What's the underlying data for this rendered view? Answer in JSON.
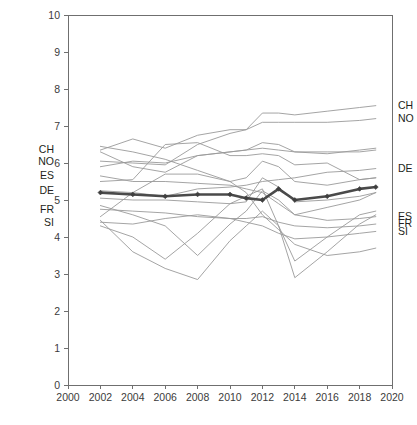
{
  "chart_data": {
    "type": "line",
    "title": "",
    "subtitle": "",
    "xlabel": "",
    "ylabel": "",
    "xlim": [
      2000,
      2020
    ],
    "ylim": [
      0,
      10
    ],
    "grid": false,
    "legend_position": "inline-end-labels",
    "x_ticks": [
      2000,
      2002,
      2004,
      2006,
      2008,
      2010,
      2012,
      2014,
      2016,
      2018,
      2020
    ],
    "y_ticks": [
      0,
      1,
      2,
      3,
      4,
      5,
      6,
      7,
      8,
      9,
      10
    ],
    "x": [
      2002,
      2004,
      2006,
      2008,
      2010,
      2011,
      2012,
      2013,
      2014,
      2016,
      2018,
      2019
    ],
    "series": [
      {
        "name": "CH",
        "label_left": "CH",
        "label_right": "CH",
        "color": "#9a9a9a",
        "highlight": false,
        "values": [
          6.35,
          6.65,
          6.4,
          6.75,
          6.9,
          6.9,
          7.35,
          7.35,
          7.3,
          7.4,
          7.5,
          7.55
        ]
      },
      {
        "name": "NO",
        "label_left": "NO",
        "label_right": "NO",
        "color": "#9a9a9a",
        "highlight": false,
        "values": [
          6.05,
          6.0,
          5.95,
          6.5,
          6.8,
          6.9,
          7.1,
          7.1,
          7.1,
          7.1,
          7.15,
          7.2
        ]
      },
      {
        "name": "ES",
        "label_left": "ES",
        "label_right": "ES",
        "color": "#9a9a9a",
        "highlight": false,
        "values": [
          5.65,
          5.5,
          5.5,
          5.45,
          5.4,
          5.3,
          5.2,
          4.9,
          4.6,
          4.45,
          4.5,
          4.55
        ]
      },
      {
        "name": "DE",
        "label_left": "DE",
        "label_right": "DE",
        "color": "#9a9a9a",
        "highlight": false,
        "values": [
          5.25,
          5.2,
          5.1,
          5.3,
          5.35,
          5.4,
          5.5,
          5.55,
          5.6,
          5.75,
          5.8,
          5.85
        ]
      },
      {
        "name": "FR",
        "label_left": "FR",
        "label_right": "FR",
        "color": "#9a9a9a",
        "highlight": false,
        "values": [
          4.75,
          4.7,
          4.65,
          4.55,
          4.5,
          4.5,
          4.55,
          4.4,
          4.3,
          4.25,
          4.3,
          4.35
        ]
      },
      {
        "name": "SI",
        "label_left": "SI",
        "label_right": "SI",
        "color": "#9a9a9a",
        "highlight": false,
        "values": [
          4.4,
          4.35,
          4.5,
          4.6,
          4.5,
          4.4,
          4.3,
          4.1,
          3.95,
          4.0,
          4.1,
          4.15
        ]
      },
      {
        "name": "country-7",
        "label_left": "",
        "label_right": "",
        "color": "#9a9a9a",
        "highlight": false,
        "values": [
          6.3,
          5.9,
          5.75,
          6.2,
          6.3,
          6.35,
          6.55,
          6.5,
          6.3,
          6.25,
          6.35,
          6.4
        ]
      },
      {
        "name": "country-8",
        "label_left": "",
        "label_right": "",
        "color": "#9a9a9a",
        "highlight": false,
        "values": [
          5.9,
          6.05,
          6.0,
          6.2,
          6.3,
          6.35,
          6.4,
          6.35,
          6.3,
          6.3,
          6.3,
          6.35
        ]
      },
      {
        "name": "country-9",
        "label_left": "",
        "label_right": "",
        "color": "#9a9a9a",
        "highlight": false,
        "values": [
          5.5,
          5.55,
          6.5,
          6.55,
          6.2,
          6.2,
          6.25,
          6.2,
          5.95,
          6.0,
          5.55,
          5.6
        ]
      },
      {
        "name": "country-10",
        "label_left": "",
        "label_right": "",
        "color": "#9a9a9a",
        "highlight": false,
        "values": [
          4.55,
          5.2,
          5.7,
          5.7,
          5.5,
          5.6,
          6.05,
          5.9,
          5.5,
          5.4,
          5.55,
          5.6
        ]
      },
      {
        "name": "country-11",
        "label_left": "",
        "label_right": "",
        "color": "#9a9a9a",
        "highlight": false,
        "values": [
          5.05,
          5.0,
          5.0,
          4.95,
          4.9,
          4.95,
          5.6,
          5.35,
          4.95,
          5.0,
          5.1,
          5.2
        ]
      },
      {
        "name": "country-12",
        "label_left": "",
        "label_right": "",
        "color": "#9a9a9a",
        "highlight": false,
        "values": [
          4.85,
          4.6,
          4.3,
          3.5,
          4.35,
          4.7,
          5.25,
          5.0,
          4.6,
          4.8,
          5.0,
          5.2
        ]
      },
      {
        "name": "country-13",
        "label_left": "",
        "label_right": "",
        "color": "#9a9a9a",
        "highlight": false,
        "values": [
          4.45,
          3.6,
          3.15,
          2.85,
          3.9,
          4.3,
          4.7,
          4.3,
          2.9,
          3.6,
          4.35,
          4.6
        ]
      },
      {
        "name": "country-14",
        "label_left": "",
        "label_right": "",
        "color": "#9a9a9a",
        "highlight": false,
        "values": [
          4.3,
          4.0,
          3.4,
          4.1,
          4.9,
          5.1,
          5.3,
          4.3,
          3.35,
          4.0,
          4.6,
          4.7
        ]
      },
      {
        "name": "country-15",
        "label_left": "",
        "label_right": "",
        "color": "#9a9a9a",
        "highlight": false,
        "values": [
          6.45,
          6.3,
          6.1,
          5.8,
          5.5,
          5.2,
          4.6,
          4.2,
          3.8,
          3.5,
          3.6,
          3.7
        ]
      },
      {
        "name": "average",
        "label_left": "",
        "label_right": "",
        "color": "#4a4a4a",
        "highlight": true,
        "values": [
          5.2,
          5.15,
          5.1,
          5.15,
          5.15,
          5.05,
          5.0,
          5.3,
          5.0,
          5.1,
          5.3,
          5.35
        ]
      }
    ]
  },
  "axes": {
    "y_tick_labels": [
      "0",
      "1",
      "2",
      "3",
      "4",
      "5",
      "6",
      "7",
      "8",
      "9",
      "10"
    ],
    "x_tick_labels": [
      "2000",
      "2002",
      "2004",
      "2006",
      "2008",
      "2010",
      "2012",
      "2014",
      "2016",
      "2018",
      "2020"
    ]
  },
  "caption": {
    "text": ""
  }
}
